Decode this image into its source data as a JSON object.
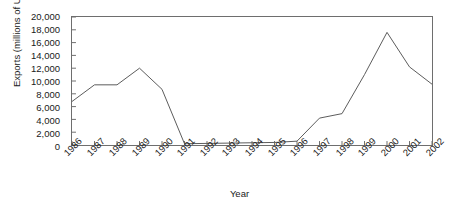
{
  "chart_data": {
    "type": "line",
    "title": "",
    "xlabel": "Year",
    "ylabel": "Exports (millions of U.S. dollars)",
    "categories": [
      "1986",
      "1987",
      "1988",
      "1989",
      "1990",
      "1991",
      "1992",
      "1993",
      "1994",
      "1995",
      "1996",
      "1997",
      "1998",
      "1999",
      "2000",
      "2001",
      "2002"
    ],
    "values": [
      6800,
      9400,
      9400,
      12000,
      8700,
      200,
      250,
      300,
      350,
      400,
      600,
      4200,
      4900,
      11000,
      17600,
      12200,
      9500
    ],
    "series": [
      {
        "name": "Exports",
        "values": [
          6800,
          9400,
          9400,
          12000,
          8700,
          200,
          250,
          300,
          350,
          400,
          600,
          4200,
          4900,
          11000,
          17600,
          12200,
          9500
        ]
      }
    ],
    "ylim": [
      0,
      20000
    ],
    "xlim": [
      "1986",
      "2002"
    ],
    "ytick_labels": [
      "20,000",
      "18,000",
      "16,000",
      "14,000",
      "12,000",
      "10,000",
      "8,000",
      "6,000",
      "4,000",
      "2,000",
      "0"
    ],
    "ytick_values": [
      20000,
      18000,
      16000,
      14000,
      12000,
      10000,
      8000,
      6000,
      4000,
      2000,
      0
    ],
    "grid": false,
    "legend": false,
    "legend_position": "none",
    "line_color": "#5a5a5a",
    "frame_color": "#6e6e6e",
    "background_color": "#ffffff"
  }
}
